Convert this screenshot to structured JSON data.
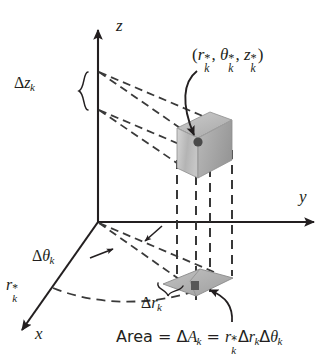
{
  "figure": {
    "background_color": "#ffffff",
    "ink_color": "#231f20",
    "shade_light": "#c9c9c9",
    "shade_mid": "#b0b0b0",
    "shade_dark": "#9a9a9a",
    "point_color": "#4a4a4a"
  },
  "axes": {
    "z": {
      "label": "z"
    },
    "y": {
      "label": "y"
    },
    "x": {
      "label": "x"
    }
  },
  "labels": {
    "delta_z": {
      "delta": "Δ",
      "var": "z",
      "sub": "k"
    },
    "delta_theta": {
      "delta": "Δ",
      "var": "θ",
      "sub": "k"
    },
    "delta_r": {
      "delta": "Δ",
      "var": "r",
      "sub": "k"
    },
    "r_star": {
      "var": "r",
      "sub": "k",
      "sup": "*"
    },
    "sample_point": {
      "open": "(",
      "r": "r",
      "r_sub": "k",
      "r_sup": "*",
      "comma1": ",",
      "theta": "θ",
      "theta_sub": "k",
      "theta_sup": "*",
      "comma2": ",",
      "z": "z",
      "z_sub": "k",
      "z_sup": "*",
      "close": ")"
    },
    "area_caption": {
      "area_word": "Area",
      "eq1": "=",
      "delta_A": "Δ",
      "A": "A",
      "A_sub": "k",
      "eq2": "=",
      "r": "r",
      "r_sub": "k",
      "r_sup": "*",
      "delta_r": "Δ",
      "r2": "r",
      "r2_sub": "k",
      "delta_theta": "Δ",
      "theta": "θ",
      "theta_sub": "k"
    }
  },
  "elements": {
    "wedge_solid": "cylindrical-wedge-solid",
    "base_patch": "base-area-patch",
    "sample_dot": "sample-point-dot",
    "brace_delta_z": "delta-z-brace",
    "brace_delta_r": "delta-r-brace",
    "arc_theta": "theta-arc",
    "leader_point": "sample-point-leader",
    "leader_area": "area-caption-leader"
  }
}
